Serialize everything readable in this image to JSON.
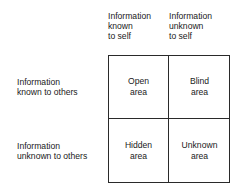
{
  "columns": [
    {
      "lines": [
        "Information",
        "known",
        "to self"
      ]
    },
    {
      "lines": [
        "Information",
        "unknown",
        "to self"
      ]
    }
  ],
  "rows": [
    {
      "lines": [
        "Information",
        "known to others"
      ]
    },
    {
      "lines": [
        "Information",
        "unknown to others"
      ]
    }
  ],
  "cells": [
    {
      "row": 0,
      "col": 0,
      "lines": [
        "Open",
        "area"
      ]
    },
    {
      "row": 0,
      "col": 1,
      "lines": [
        "Blind",
        "area"
      ]
    },
    {
      "row": 1,
      "col": 0,
      "lines": [
        "Hidden",
        "area"
      ]
    },
    {
      "row": 1,
      "col": 1,
      "lines": [
        "Unknown",
        "area"
      ]
    }
  ]
}
